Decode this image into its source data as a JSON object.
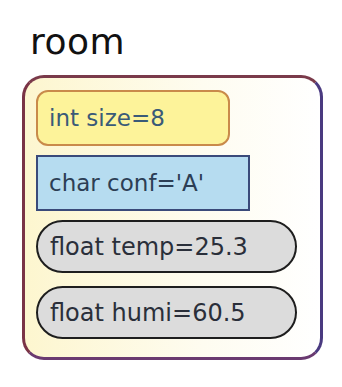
{
  "title": "room",
  "fields": [
    {
      "type": "int",
      "name": "size",
      "value": "8",
      "label": "int size=8",
      "shape": "rounded-rectangle",
      "fill": "#fdf39a",
      "stroke": "#c98a4a"
    },
    {
      "type": "char",
      "name": "conf",
      "value": "'A'",
      "label": "char conf='A'",
      "shape": "rectangle",
      "fill": "#b6dcf0",
      "stroke": "#3a4a7a"
    },
    {
      "type": "float",
      "name": "temp",
      "value": "25.3",
      "label": "float temp=25.3",
      "shape": "pill",
      "fill": "#dcdcdc",
      "stroke": "#1e1e1e"
    },
    {
      "type": "float",
      "name": "humi",
      "value": "60.5",
      "label": "float humi=60.5",
      "shape": "pill",
      "fill": "#dcdcdc",
      "stroke": "#1e1e1e"
    }
  ],
  "colors": {
    "container_fill": "#fdf6cf",
    "container_stroke": "#6b3a6e"
  }
}
